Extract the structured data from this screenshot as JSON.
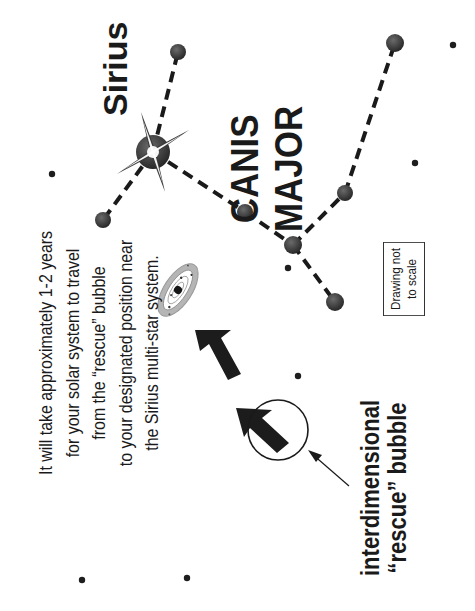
{
  "diagram": {
    "title_star": "Sirius",
    "constellation": {
      "line1": "CANIS",
      "line2": "MAJOR"
    },
    "caption": {
      "lines": [
        "It will take approximately 1-2 years",
        "for your solar system to travel",
        "from the “rescue” bubble",
        "to your designated position near",
        "the Sirius multi-star system."
      ]
    },
    "bubble_label": {
      "line1": "interdimensional",
      "line2": "“rescue” bubble"
    },
    "note": {
      "line1": "Drawing not",
      "line2": "to scale"
    },
    "orientation": "rotated 90 degrees counter-clockwise",
    "colors": {
      "ink": "#1a1a1a",
      "star": "#2f2f2f",
      "ring": "#a8a8a8",
      "background": "#ffffff"
    },
    "stars": [
      {
        "id": "sirius",
        "x": 153,
        "y": 152,
        "r": 17,
        "bright": true
      },
      {
        "id": "s-top",
        "x": 178,
        "y": 52,
        "r": 8
      },
      {
        "id": "s-left",
        "x": 103,
        "y": 220,
        "r": 8
      },
      {
        "id": "s-mid",
        "x": 245,
        "y": 212,
        "r": 8
      },
      {
        "id": "s-junction",
        "x": 293,
        "y": 245,
        "r": 9
      },
      {
        "id": "s-bottom",
        "x": 335,
        "y": 302,
        "r": 9
      },
      {
        "id": "s-right-mid",
        "x": 345,
        "y": 193,
        "r": 8
      },
      {
        "id": "s-right-top",
        "x": 395,
        "y": 43,
        "r": 9
      }
    ],
    "constellation_lines": [
      [
        "sirius",
        "s-top"
      ],
      [
        "sirius",
        "s-left"
      ],
      [
        "sirius",
        "s-mid"
      ],
      [
        "s-mid",
        "s-junction"
      ],
      [
        "s-junction",
        "s-bottom"
      ],
      [
        "s-junction",
        "s-right-mid"
      ],
      [
        "s-right-mid",
        "s-right-top"
      ]
    ],
    "background_dots": [
      {
        "x": 52,
        "y": 174
      },
      {
        "x": 453,
        "y": 45
      },
      {
        "x": 415,
        "y": 163
      },
      {
        "x": 288,
        "y": 268
      },
      {
        "x": 298,
        "y": 376
      },
      {
        "x": 82,
        "y": 580
      },
      {
        "x": 187,
        "y": 578
      }
    ],
    "solar_system": {
      "x": 178,
      "y": 290
    },
    "rescue_bubble": {
      "x": 278,
      "y": 430,
      "r": 30
    }
  }
}
